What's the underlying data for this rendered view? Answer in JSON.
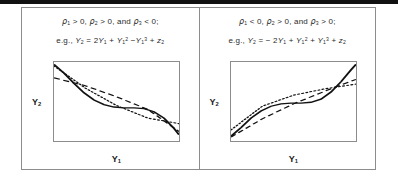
{
  "figure": {
    "name": "two-panel-curve-comparison"
  },
  "panels": [
    {
      "id": "left",
      "condition_text": "ρ₁ > 0, ρ₂ > 0, and ρ₃ < 0;",
      "condition_parts": {
        "rho1": "ρ",
        "rho1_sub": "1",
        "rel1": "> 0,",
        "rho2": "ρ",
        "rho2_sub": "2",
        "rel2": "> 0, and",
        "rho3": "ρ",
        "rho3_sub": "3",
        "rel3": "< 0;"
      },
      "equation_text": "e.g., Y₂ = 2Y₁ + Y₁² −Y₁³ + z₂",
      "equation_parts": {
        "prefix": "e.g.,",
        "lhs_var": "Y",
        "lhs_sub": "2",
        "equals": "=",
        "t1_coef": "2",
        "t1_var": "Y",
        "t1_sub": "1",
        "op1": "+",
        "t2_var": "Y",
        "t2_sub": "1",
        "t2_sup": "2",
        "op2": "−",
        "t3_var": "Y",
        "t3_sub": "1",
        "t3_sup": "3",
        "op3": "+",
        "t4_var": "z",
        "t4_sub": "2"
      },
      "ylabel": "Y",
      "ylabel_sub": "2",
      "xlabel": "Y",
      "xlabel_sub": "1",
      "chart_ref": 0
    },
    {
      "id": "right",
      "condition_text": "ρ₁ < 0, ρ₂ > 0, and ρ₃ > 0;",
      "condition_parts": {
        "rho1": "ρ",
        "rho1_sub": "1",
        "rel1": "< 0,",
        "rho2": "ρ",
        "rho2_sub": "2",
        "rel2": "> 0, and",
        "rho3": "ρ",
        "rho3_sub": "3",
        "rel3": "> 0;"
      },
      "equation_text": "e.g., Y₂ = − 2Y₁ + Y₁² + Y₁³ + z₂",
      "equation_parts": {
        "prefix": "e.g.,",
        "lhs_var": "Y",
        "lhs_sub": "2",
        "equals": "= −",
        "t1_coef": "2",
        "t1_var": "Y",
        "t1_sub": "1",
        "op1": "+",
        "t2_var": "Y",
        "t2_sub": "1",
        "t2_sup": "2",
        "op2": "+",
        "t3_var": "Y",
        "t3_sub": "1",
        "t3_sup": "3",
        "op3": "+",
        "t4_var": "z",
        "t4_sub": "2"
      },
      "ylabel": "Y",
      "ylabel_sub": "2",
      "xlabel": "Y",
      "xlabel_sub": "1",
      "chart_ref": 1
    }
  ],
  "chart_data": [
    {
      "type": "line",
      "title": "",
      "xlabel": "Y1",
      "ylabel": "Y2",
      "xlim": [
        0,
        1
      ],
      "ylim": [
        0,
        1
      ],
      "grid": false,
      "legend": "none",
      "note": "Decreasing cubic Y2 = 2Y1 + Y1^2 - Y1^3 + z2 rendered as a falling S-curve with straight dashed and dotted approximations.",
      "series": [
        {
          "name": "true-curve-solid",
          "style": "solid",
          "x": [
            0.0,
            0.08,
            0.16,
            0.24,
            0.32,
            0.4,
            0.48,
            0.56,
            0.64,
            0.72,
            0.8,
            0.88,
            0.96,
            1.0
          ],
          "y": [
            0.97,
            0.86,
            0.73,
            0.61,
            0.52,
            0.46,
            0.43,
            0.42,
            0.42,
            0.41,
            0.37,
            0.29,
            0.16,
            0.08
          ]
        },
        {
          "name": "linear-approx-dashed",
          "style": "dashed",
          "x": [
            0.0,
            0.25,
            0.5,
            0.75,
            1.0
          ],
          "y": [
            0.8,
            0.7,
            0.56,
            0.4,
            0.12
          ]
        },
        {
          "name": "alt-approx-dotted",
          "style": "dotted",
          "x": [
            0.0,
            0.25,
            0.5,
            0.75,
            1.0
          ],
          "y": [
            0.95,
            0.67,
            0.45,
            0.29,
            0.22
          ]
        }
      ]
    },
    {
      "type": "line",
      "title": "",
      "xlabel": "Y1",
      "ylabel": "Y2",
      "xlim": [
        0,
        1
      ],
      "ylim": [
        0,
        1
      ],
      "grid": false,
      "legend": "none",
      "note": "Increasing cubic Y2 = -2Y1 + Y1^2 + Y1^3 + z2 rendered as a rising S-curve with straight dashed and dotted approximations.",
      "series": [
        {
          "name": "true-curve-solid",
          "style": "solid",
          "x": [
            0.0,
            0.08,
            0.16,
            0.24,
            0.32,
            0.4,
            0.48,
            0.56,
            0.64,
            0.72,
            0.8,
            0.88,
            0.96,
            1.0
          ],
          "y": [
            0.06,
            0.17,
            0.29,
            0.38,
            0.44,
            0.47,
            0.48,
            0.48,
            0.49,
            0.53,
            0.62,
            0.75,
            0.9,
            0.97
          ]
        },
        {
          "name": "linear-approx-dashed",
          "style": "dashed",
          "x": [
            0.0,
            0.25,
            0.5,
            0.75,
            1.0
          ],
          "y": [
            0.05,
            0.28,
            0.47,
            0.63,
            0.78
          ]
        },
        {
          "name": "alt-approx-dotted",
          "style": "dotted",
          "x": [
            0.0,
            0.25,
            0.5,
            0.75,
            1.0
          ],
          "y": [
            0.14,
            0.44,
            0.58,
            0.66,
            0.72
          ]
        }
      ]
    }
  ]
}
